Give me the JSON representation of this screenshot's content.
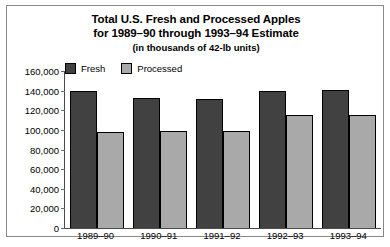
{
  "chart_data": {
    "type": "bar",
    "title": "Total U.S. Fresh and Processed Apples",
    "title_line2": "for 1989–90 through 1993–94 Estimate",
    "subtitle": "(in thousands of 42-lb units)",
    "xlabel": "",
    "ylabel": "",
    "ylim": [
      0,
      160000
    ],
    "grid": false,
    "legend_position": "top-left",
    "categories": [
      "1989–90",
      "1990–91",
      "1991–92",
      "1992–93",
      "1993–94"
    ],
    "yticks": [
      {
        "value": 160000,
        "label": "160,000"
      },
      {
        "value": 140000,
        "label": "140,000"
      },
      {
        "value": 120000,
        "label": "120,000"
      },
      {
        "value": 100000,
        "label": "100,000"
      },
      {
        "value": 80000,
        "label": "80,000"
      },
      {
        "value": 60000,
        "label": "60,000"
      },
      {
        "value": 40000,
        "label": "40,000"
      },
      {
        "value": 20000,
        "label": "20,000"
      },
      {
        "value": 0,
        "label": "0"
      }
    ],
    "series": [
      {
        "name": "Fresh",
        "color": "#414141",
        "values": [
          140000,
          132000,
          131000,
          140000,
          141000
        ]
      },
      {
        "name": "Processed",
        "color": "#a9a9a9",
        "values": [
          98000,
          99000,
          99000,
          115000,
          115000
        ]
      }
    ]
  },
  "legend": {
    "entries": [
      {
        "label": "Fresh",
        "color": "#414141"
      },
      {
        "label": "Processed",
        "color": "#a9a9a9"
      }
    ]
  }
}
